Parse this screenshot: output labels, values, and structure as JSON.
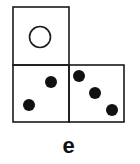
{
  "figure": {
    "label": "e",
    "faces": [
      {
        "name": "top-face",
        "x": 13,
        "y": 7,
        "w": 56,
        "h": 58,
        "pips": [],
        "circles": [
          {
            "cx": 40,
            "cy": 37,
            "r": 11
          }
        ]
      },
      {
        "name": "bottom-left-face",
        "x": 13,
        "y": 65,
        "w": 56,
        "h": 57,
        "pips": [
          {
            "cx": 51,
            "cy": 82
          },
          {
            "cx": 29,
            "cy": 105
          }
        ],
        "circles": []
      },
      {
        "name": "bottom-right-face",
        "x": 69,
        "y": 65,
        "w": 55,
        "h": 57,
        "pips": [
          {
            "cx": 79,
            "cy": 76
          },
          {
            "cx": 95,
            "cy": 93
          },
          {
            "cx": 112,
            "cy": 110
          }
        ],
        "circles": []
      }
    ],
    "colors": {
      "stroke": "#1a1a1a",
      "pip": "#111111",
      "background": "#ffffff"
    }
  }
}
